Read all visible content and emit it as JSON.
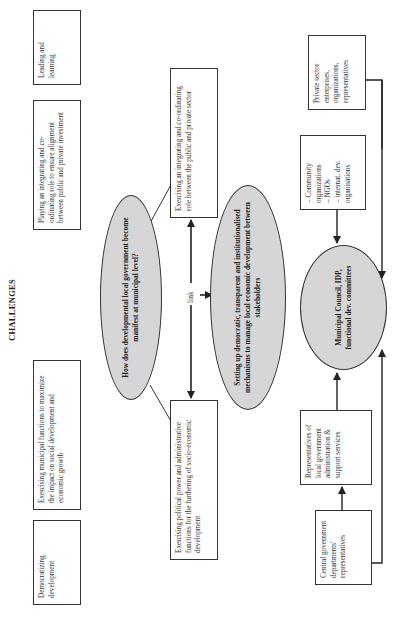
{
  "diagram": {
    "title": "CHALLENGES",
    "challenges": [
      {
        "id": "democratizing",
        "text": "Democratizing development"
      },
      {
        "id": "municipal-functions",
        "text": "Exercising municipal functions to maximize the impact on social development and economic growth"
      },
      {
        "id": "integrating-investment",
        "text": "Playing an integrating and co-ordinating role to ensure alignment between public and private investment"
      },
      {
        "id": "leading-learning",
        "text": "Leading and learning"
      }
    ],
    "central_question": "How does developmental local government become manifest at municipal level?",
    "link_label": "link",
    "branches": {
      "political_power": "Exercising political power and administrative functions for the furthering of socio-economic development",
      "integrating_role": "Exercising an integrating and co-ordinating role between the public and private sector"
    },
    "mechanisms": "Setting up democratic, transparent and institutionalised mechanisms to manage local economic development between stakeholders",
    "council": "Municipal Council, IDP, functional dev. committees",
    "stakeholders": {
      "private_sector": "Private sector enterprises, organizations, representatives",
      "community_items": [
        "Community organizations",
        "NGOs",
        "internat. dev. organisations"
      ],
      "local_gov_reps": "Representatives of local government administration & support services",
      "central_gov_reps": "Central government departments' representatives"
    },
    "colors": {
      "ellipse_fill": "#d6d6d6",
      "line": "#333333",
      "background": "#ffffff"
    }
  }
}
